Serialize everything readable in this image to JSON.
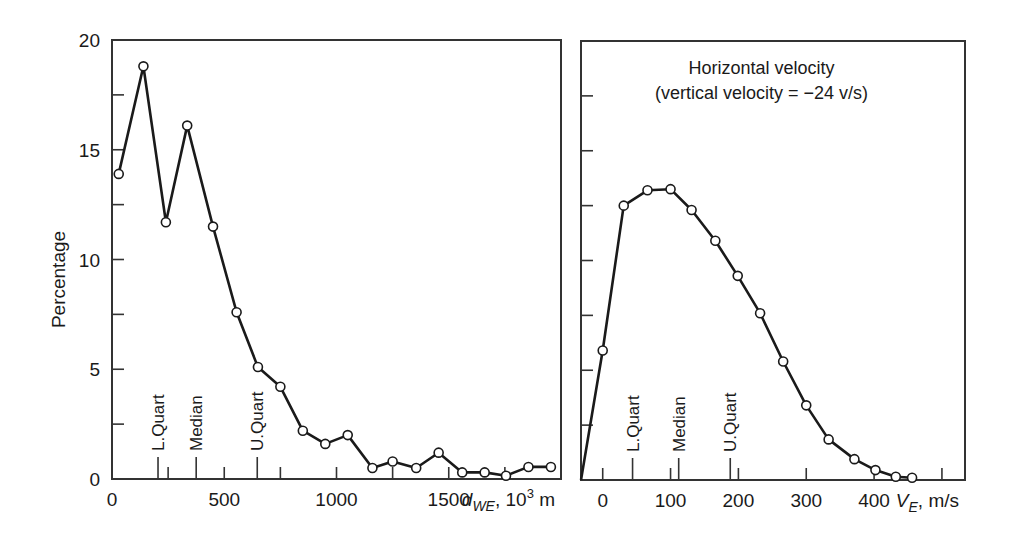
{
  "chart_data": [
    {
      "type": "line",
      "panel": "left",
      "title": "",
      "xlabel": "d_WE, 10^3 m",
      "xlabel_parts": {
        "var": "d",
        "sub": "WE",
        "rest": ", 10",
        "sup": "3",
        "unit": " m"
      },
      "ylabel": "Percentage",
      "xlim": [
        0,
        2000
      ],
      "ylim": [
        0,
        20
      ],
      "xticks": [
        0,
        500,
        1000,
        1500
      ],
      "xtick_labels": [
        "0",
        "500",
        "1000",
        "1500"
      ],
      "minor_xticks": [
        250,
        750,
        1250,
        1750
      ],
      "yticks": [
        0,
        5,
        10,
        15,
        20
      ],
      "ytick_labels": [
        "0",
        "5",
        "10",
        "15",
        "20"
      ],
      "minor_yticks": [
        2.5,
        7.5,
        12.5,
        17.5
      ],
      "grid": false,
      "markers": [
        {
          "label": "L.Quart",
          "x": 205
        },
        {
          "label": "Median",
          "x": 375
        },
        {
          "label": "U.Quart",
          "x": 647
        }
      ],
      "series": [
        {
          "name": "Distance distribution",
          "x": [
            30,
            140,
            240,
            335,
            450,
            555,
            650,
            750,
            850,
            950,
            1050,
            1160,
            1250,
            1355,
            1455,
            1560,
            1660,
            1755,
            1855,
            1955
          ],
          "values": [
            13.9,
            18.8,
            11.7,
            16.1,
            11.5,
            7.6,
            5.1,
            4.2,
            2.2,
            1.6,
            2.0,
            0.5,
            0.8,
            0.5,
            1.2,
            0.3,
            0.3,
            0.15,
            0.55,
            0.55
          ]
        }
      ]
    },
    {
      "type": "line",
      "panel": "right",
      "title": "Horizontal velocity",
      "subtitle": "(vertical velocity = −24 v/s)",
      "xlabel": "V_E, m/s",
      "xlabel_parts": {
        "var": "V",
        "sub": "E",
        "rest": ", m/s"
      },
      "ylabel": "",
      "xlim": [
        -32,
        534
      ],
      "ylim": [
        0,
        20
      ],
      "xticks": [
        0,
        100,
        200,
        300,
        400,
        500
      ],
      "xtick_labels": [
        "0",
        "100",
        "200",
        "300",
        "400",
        ""
      ],
      "yticks": [
        2.5,
        5,
        7.5,
        10,
        12.5,
        15,
        17.5
      ],
      "grid": false,
      "markers": [
        {
          "label": "L.Quart",
          "x": 44
        },
        {
          "label": "Median",
          "x": 112
        },
        {
          "label": "U.Quart",
          "x": 188
        }
      ],
      "series": [
        {
          "name": "Horizontal velocity distribution",
          "x": [
            -32,
            0,
            31,
            66,
            100,
            131,
            166,
            199,
            232,
            266,
            300,
            333,
            371,
            402,
            432,
            456
          ],
          "values": [
            0,
            5.9,
            12.5,
            13.2,
            13.25,
            12.3,
            10.9,
            9.3,
            7.6,
            5.4,
            3.4,
            1.85,
            0.95,
            0.45,
            0.15,
            0.1
          ],
          "marker_start_index": 1
        }
      ]
    }
  ],
  "layout": {
    "left_panel": {
      "x0": 112,
      "x1": 561,
      "y_top": 40,
      "y_bottom": 479
    },
    "right_panel": {
      "x0": 581,
      "x1": 965,
      "y_top": 41,
      "y_bottom": 480
    }
  }
}
